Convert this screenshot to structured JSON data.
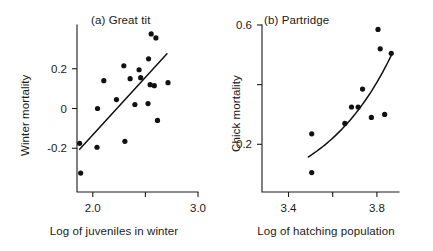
{
  "figure": {
    "background": "#ffffff",
    "ink_color": "#111111"
  },
  "chart_data": [
    {
      "type": "scatter",
      "title": "(a) Great tit",
      "panel_letter": "(a)",
      "species": "Great tit",
      "xlabel": "Log of juveniles in winter",
      "ylabel": "Winter mortality",
      "xlim": [
        1.85,
        3.0
      ],
      "ylim": [
        -0.42,
        0.42
      ],
      "xticks": [
        2.0,
        2.5,
        3.0
      ],
      "xtick_labels": [
        "2.0",
        "",
        "3.0"
      ],
      "yticks": [
        0.2,
        0.0,
        -0.2
      ],
      "ytick_labels": [
        "0.2",
        "0",
        "-0.2"
      ],
      "grid": false,
      "legend": "none",
      "points": [
        {
          "x": 1.885,
          "y": -0.325
        },
        {
          "x": 1.875,
          "y": -0.175
        },
        {
          "x": 2.04,
          "y": -0.195
        },
        {
          "x": 2.045,
          "y": 0.0
        },
        {
          "x": 2.105,
          "y": 0.14
        },
        {
          "x": 2.225,
          "y": 0.045
        },
        {
          "x": 2.305,
          "y": -0.165
        },
        {
          "x": 2.295,
          "y": 0.215
        },
        {
          "x": 2.355,
          "y": 0.15
        },
        {
          "x": 2.4,
          "y": 0.02
        },
        {
          "x": 2.44,
          "y": 0.195
        },
        {
          "x": 2.455,
          "y": 0.155
        },
        {
          "x": 2.525,
          "y": 0.025
        },
        {
          "x": 2.53,
          "y": 0.25
        },
        {
          "x": 2.545,
          "y": 0.12
        },
        {
          "x": 2.555,
          "y": 0.375
        },
        {
          "x": 2.585,
          "y": 0.115
        },
        {
          "x": 2.6,
          "y": 0.355
        },
        {
          "x": 2.615,
          "y": -0.06
        },
        {
          "x": 2.715,
          "y": 0.13
        }
      ],
      "fit": {
        "kind": "line",
        "x_start": 1.875,
        "y_start": -0.205,
        "x_end": 2.705,
        "y_end": 0.275
      }
    },
    {
      "type": "scatter",
      "title": "(b) Partridge",
      "panel_letter": "(b)",
      "species": "Partridge",
      "xlabel": "Log of hatching population",
      "ylabel": "Chick mortality",
      "xlim": [
        3.28,
        3.9
      ],
      "ylim": [
        0.04,
        0.6
      ],
      "xticks": [
        3.4,
        3.6,
        3.8
      ],
      "xtick_labels": [
        "3.4",
        "",
        "3.8"
      ],
      "yticks": [
        0.6,
        0.4,
        0.2
      ],
      "ytick_labels": [
        "0.6",
        "",
        "0.2"
      ],
      "grid": false,
      "legend": "none",
      "points": [
        {
          "x": 3.505,
          "y": 0.105
        },
        {
          "x": 3.505,
          "y": 0.235
        },
        {
          "x": 3.655,
          "y": 0.27
        },
        {
          "x": 3.685,
          "y": 0.325
        },
        {
          "x": 3.715,
          "y": 0.325
        },
        {
          "x": 3.735,
          "y": 0.385
        },
        {
          "x": 3.775,
          "y": 0.29
        },
        {
          "x": 3.805,
          "y": 0.585
        },
        {
          "x": 3.815,
          "y": 0.52
        },
        {
          "x": 3.835,
          "y": 0.3
        },
        {
          "x": 3.865,
          "y": 0.505
        }
      ],
      "fit": {
        "kind": "curve",
        "x_start": 3.49,
        "x_end": 3.865,
        "description": "upward-curving exponential trend"
      }
    }
  ]
}
